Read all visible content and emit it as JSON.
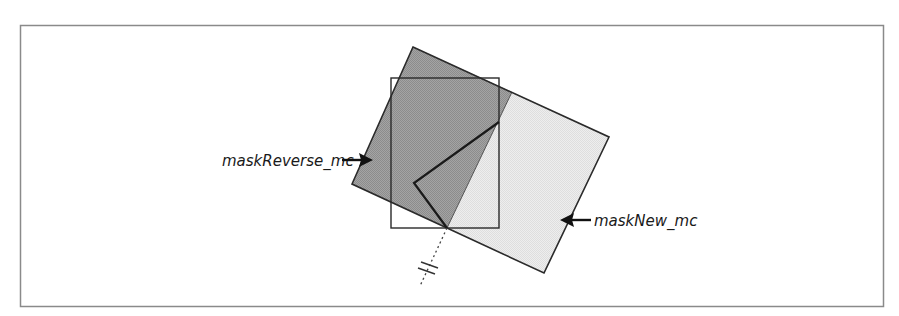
{
  "diagram": {
    "frame": {
      "x": 20,
      "y": 25,
      "width": 863,
      "height": 281,
      "stroke": "#8a8a8a"
    },
    "colors": {
      "dark_fill": "#9b9b9b",
      "light_fill": "#e9e9e9",
      "stroke": "#2a2a2a"
    },
    "shapes": {
      "mask_reverse": {
        "name": "maskReverse_mc",
        "points": "413,47 512,92 447,228 352,184"
      },
      "mask_new": {
        "name": "maskNew_mc",
        "points": "512,92 609,137 544,273 447,228"
      },
      "outline": {
        "points": "413,47 609,137 544,273 447,228 352,184"
      },
      "upright_rect": {
        "x": 391,
        "y": 78,
        "width": 108,
        "height": 150
      },
      "fold_polyline": {
        "points": "499,122 414,183 447,228"
      },
      "dotted_axis": {
        "x1": 447,
        "y1": 228,
        "x2": 420,
        "y2": 286
      }
    },
    "labels": {
      "mask_reverse": {
        "text": "maskReverse_mc",
        "x": 222,
        "y": 166
      },
      "mask_new": {
        "text": "maskNew_mc",
        "x": 594,
        "y": 227
      }
    },
    "arrows": {
      "mask_reverse": {
        "x1": 342,
        "y1": 160,
        "x2": 373,
        "y2": 160,
        "direction": "right"
      },
      "mask_new": {
        "x1": 591,
        "y1": 220,
        "x2": 561,
        "y2": 220,
        "direction": "left"
      }
    }
  }
}
